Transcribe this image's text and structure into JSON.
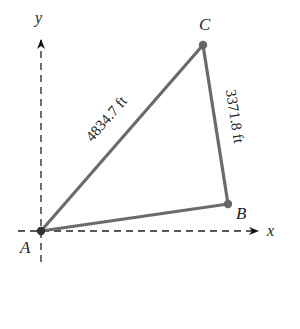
{
  "diagram": {
    "type": "triangle-on-coordinate-axes",
    "axes": {
      "x_label": "x",
      "y_label": "y"
    },
    "points": {
      "A": {
        "label": "A",
        "px": [
          41,
          231
        ]
      },
      "B": {
        "label": "B",
        "px": [
          228,
          204
        ]
      },
      "C": {
        "label": "C",
        "px": [
          203,
          45
        ]
      }
    },
    "sides": {
      "AC": {
        "label": "4834.7 ft"
      },
      "BC": {
        "label": "3371.8 ft"
      }
    },
    "colors": {
      "triangle": "#6b6b6b",
      "axes": "#222222",
      "text": "#222222"
    }
  }
}
